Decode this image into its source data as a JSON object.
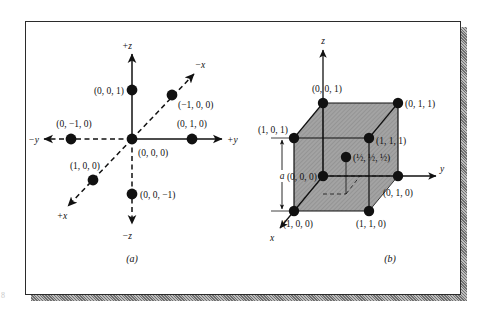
{
  "figure": {
    "page_number": "8",
    "panels": [
      {
        "id": "a",
        "caption": "(a)",
        "title": "Crystallographic axes with unit point coordinates",
        "axis_labels": {
          "plus_z": "+z",
          "minus_z": "−z",
          "plus_y": "+y",
          "minus_y": "−y",
          "plus_x": "+x",
          "minus_x": "−x"
        },
        "points": [
          {
            "name": "origin",
            "label": "(0, 0, 0)"
          },
          {
            "name": "plus-z-point",
            "label": "(0, 0, 1)"
          },
          {
            "name": "minus-z-point",
            "label": "(0, 0, −1)"
          },
          {
            "name": "plus-y-point",
            "label": "(0, 1, 0)"
          },
          {
            "name": "minus-y-point",
            "label": "(0, −1, 0)"
          },
          {
            "name": "plus-x-point",
            "label": "(1, 0, 0)"
          },
          {
            "name": "minus-x-point",
            "label": "(−1, 0, 0)"
          }
        ]
      },
      {
        "id": "b",
        "caption": "(b)",
        "title": "Unit cell with corner and body-center coordinates",
        "axis_labels": {
          "z": "z",
          "y": "y",
          "x": "x"
        },
        "dimension_label": "a",
        "points": [
          {
            "name": "corner-000",
            "label": "(0, 0, 0)"
          },
          {
            "name": "corner-001",
            "label": "(0, 0, 1)"
          },
          {
            "name": "corner-011",
            "label": "(0, 1, 1)"
          },
          {
            "name": "corner-010",
            "label": "(0, 1, 0)"
          },
          {
            "name": "corner-101",
            "label": "(1, 0, 1)"
          },
          {
            "name": "corner-111",
            "label": "(1, 1, 1)"
          },
          {
            "name": "corner-100",
            "label": "(1, 0, 0)"
          },
          {
            "name": "corner-110",
            "label": "(1, 1, 0)"
          },
          {
            "name": "body-center",
            "label": "(½, ½, ½)"
          }
        ]
      }
    ]
  },
  "colors": {
    "ink": "#111111",
    "cell_fill": "#9a9a9a",
    "frame": "#2b2b2b",
    "shadow": "#8d8d8d"
  }
}
